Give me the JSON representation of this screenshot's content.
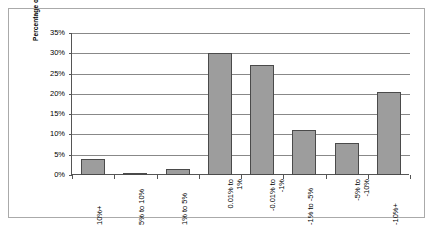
{
  "chart_data": {
    "type": "bar",
    "title": "",
    "subtitle": "",
    "xlabel": "",
    "ylabel": "Percentage of Loans",
    "categories": [
      "10%+",
      "5% to 10%",
      "1% to 5%",
      "0.01% to 1%",
      "-0.01% to -1%",
      "-1% to -5%",
      "-5% to -10%",
      "-10%+"
    ],
    "category_lines": [
      [
        "10%+"
      ],
      [
        "5% to 10%"
      ],
      [
        "1% to 5%"
      ],
      [
        "0.01% to",
        "1%"
      ],
      [
        "-0.01% to",
        "-1%"
      ],
      [
        "-1% to -5%"
      ],
      [
        "-5% to",
        "-10%"
      ],
      [
        "-10%+"
      ]
    ],
    "values": [
      4,
      0.5,
      1.5,
      30,
      27,
      11,
      8,
      20.5
    ],
    "value_labels": [
      "4%",
      "0.5%",
      "1.5%",
      "30%",
      "27%",
      "11%",
      "8%",
      "20.5%"
    ],
    "ylim": [
      0,
      35
    ],
    "ytick_labels": [
      "0%",
      "5%",
      "10%",
      "15%",
      "20%",
      "25%",
      "30%",
      "35%"
    ],
    "ytick_values": [
      0,
      5,
      10,
      15,
      20,
      25,
      30,
      35
    ],
    "grid": true,
    "legend": false,
    "legend_position": "none",
    "bar_color": "#9d9d9d",
    "bar_border_color": "#4a4a4a",
    "gridline_color": "#888888",
    "axis_color": "#555555",
    "frame_color": "#aaaaaa",
    "background_color": "#ffffff"
  }
}
